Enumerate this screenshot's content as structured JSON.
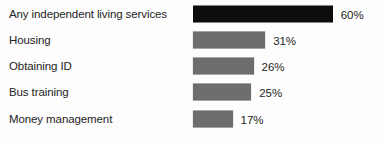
{
  "chart_data": {
    "type": "bar",
    "orientation": "horizontal",
    "title": "",
    "subtitle": "",
    "xlabel": "",
    "ylabel": "",
    "grid": false,
    "legend": null,
    "axis_visible": false,
    "xlim": [
      0,
      60
    ],
    "value_suffix": "%",
    "categories": [
      "Any independent living services",
      "Housing",
      "Obtaining ID",
      "Bus training",
      "Money management"
    ],
    "values": [
      60,
      31,
      26,
      25,
      17
    ],
    "value_labels": [
      "60%",
      "31%",
      "26%",
      "25%",
      "17%"
    ],
    "bar_colors": [
      "#0d0d0d",
      "#6d6d6d",
      "#6d6d6d",
      "#6d6d6d",
      "#6d6d6d"
    ],
    "bars": [
      {
        "label": "Any independent living services",
        "value": 60,
        "value_label": "60%",
        "color": "#0d0d0d"
      },
      {
        "label": "Housing",
        "value": 31,
        "value_label": "31%",
        "color": "#6d6d6d"
      },
      {
        "label": "Obtaining ID",
        "value": 26,
        "value_label": "26%",
        "color": "#6d6d6d"
      },
      {
        "label": "Bus training",
        "value": 25,
        "value_label": "25%",
        "color": "#6d6d6d"
      },
      {
        "label": "Money management",
        "value": 17,
        "value_label": "17%",
        "color": "#6d6d6d"
      }
    ]
  },
  "layout": {
    "bar_origin_px": 193,
    "px_per_unit": 2.33,
    "row_tops_px": [
      1,
      27,
      53,
      79,
      106
    ],
    "background": "#fdfdfd",
    "text_color": "#242424"
  }
}
